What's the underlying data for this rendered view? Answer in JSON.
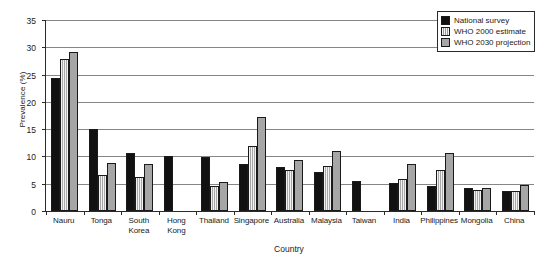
{
  "chart_data": {
    "type": "bar",
    "title": "",
    "xlabel": "Country",
    "ylabel": "Prevalence (%)",
    "ylim": [
      0,
      35
    ],
    "ytick_step": 5,
    "yticks": [
      0,
      5,
      10,
      15,
      20,
      25,
      30,
      35
    ],
    "grid": true,
    "legend_position": "top-right",
    "categories": [
      "Nauru",
      "Tonga",
      "South Korea",
      "Hong Kong",
      "Thailand",
      "Singapore",
      "Australia",
      "Malaysia",
      "Taiwan",
      "India",
      "Philippines",
      "Mongolia",
      "China"
    ],
    "series": [
      {
        "name": "National survey",
        "values": [
          24.3,
          15.1,
          10.7,
          10.0,
          9.9,
          8.7,
          8.0,
          7.2,
          5.5,
          5.2,
          4.6,
          4.2,
          3.7
        ]
      },
      {
        "name": "WHO 2000 estimate",
        "values": [
          27.9,
          6.6,
          6.3,
          null,
          4.5,
          11.9,
          7.6,
          8.2,
          null,
          5.9,
          7.5,
          3.8,
          3.6
        ]
      },
      {
        "name": "WHO 2030 projection",
        "values": [
          29.2,
          8.8,
          8.6,
          null,
          5.4,
          17.3,
          9.3,
          11.0,
          null,
          8.6,
          10.6,
          4.3,
          4.7
        ]
      }
    ]
  },
  "legend": {
    "items": [
      {
        "label": "National survey"
      },
      {
        "label": "WHO 2000 estimate"
      },
      {
        "label": "WHO 2030 projection"
      }
    ]
  }
}
